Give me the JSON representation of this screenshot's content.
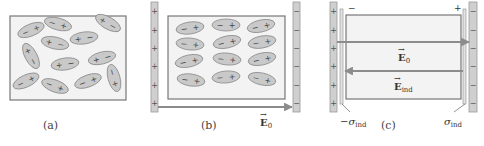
{
  "figure": {
    "colors": {
      "background": "#ffffff",
      "box_fill": "#f3f3f3",
      "box_stroke": "#777777",
      "plate_fill": "#cfcfcf",
      "plate_stroke": "#9a9a9a",
      "dipole_fill": "#c9c9c9",
      "dipole_stroke": "#8a8a8a",
      "arrow": "#8c8c8c",
      "text": "#333333"
    },
    "panels": [
      {
        "id": "a",
        "caption": "(a)",
        "description": "Randomly oriented polar molecules, no field",
        "box": {
          "x": 10,
          "y": 16,
          "w": 116,
          "h": 84
        },
        "dipoles": [
          {
            "cx": 31,
            "cy": 30,
            "rot": -22,
            "neg_left": true
          },
          {
            "cx": 58,
            "cy": 24,
            "rot": 15,
            "neg_left": true
          },
          {
            "cx": 108,
            "cy": 23,
            "rot": 30,
            "neg_left": false
          },
          {
            "cx": 55,
            "cy": 43,
            "rot": 12,
            "neg_left": false
          },
          {
            "cx": 84,
            "cy": 38,
            "rot": -8,
            "neg_left": false
          },
          {
            "cx": 31,
            "cy": 56,
            "rot": 62,
            "neg_left": false
          },
          {
            "cx": 65,
            "cy": 64,
            "rot": -8,
            "neg_left": false
          },
          {
            "cx": 102,
            "cy": 58,
            "rot": -14,
            "neg_left": false
          },
          {
            "cx": 26,
            "cy": 81,
            "rot": -25,
            "neg_left": true
          },
          {
            "cx": 55,
            "cy": 86,
            "rot": 20,
            "neg_left": true
          },
          {
            "cx": 88,
            "cy": 81,
            "rot": -20,
            "neg_left": true
          },
          {
            "cx": 114,
            "cy": 78,
            "rot": 75,
            "neg_left": true
          }
        ]
      },
      {
        "id": "b",
        "caption": "(b)",
        "description": "Dipoles aligned with external field E0",
        "box": {
          "x": 168,
          "y": 16,
          "w": 117,
          "h": 83
        },
        "left_plate": {
          "x": 151,
          "y": 2,
          "w": 7,
          "h": 110,
          "sign": "+",
          "count": 6
        },
        "right_plate": {
          "x": 293,
          "y": 2,
          "w": 7,
          "h": 110,
          "sign": "−",
          "count": 6
        },
        "field_arrow": {
          "x1": 158,
          "y1": 107,
          "x2": 292,
          "y2": 107,
          "label": "E",
          "subscript": "0"
        },
        "dipoles": [
          {
            "cx": 190,
            "cy": 28,
            "rot": -8,
            "neg_left": true
          },
          {
            "cx": 226,
            "cy": 25,
            "rot": 0,
            "neg_left": true
          },
          {
            "cx": 261,
            "cy": 26,
            "rot": -12,
            "neg_left": true
          },
          {
            "cx": 190,
            "cy": 44,
            "rot": 5,
            "neg_left": true
          },
          {
            "cx": 227,
            "cy": 42,
            "rot": -12,
            "neg_left": true
          },
          {
            "cx": 262,
            "cy": 42,
            "rot": -10,
            "neg_left": true
          },
          {
            "cx": 189,
            "cy": 61,
            "rot": -12,
            "neg_left": true
          },
          {
            "cx": 227,
            "cy": 59,
            "rot": 5,
            "neg_left": true
          },
          {
            "cx": 262,
            "cy": 59,
            "rot": -12,
            "neg_left": true
          },
          {
            "cx": 191,
            "cy": 80,
            "rot": 8,
            "neg_left": true
          },
          {
            "cx": 226,
            "cy": 77,
            "rot": -5,
            "neg_left": true
          },
          {
            "cx": 262,
            "cy": 79,
            "rot": 12,
            "neg_left": true
          }
        ]
      },
      {
        "id": "c",
        "caption": "(c)",
        "description": "Induced surface charge and induced field",
        "box": {
          "x": 346,
          "y": 15,
          "w": 115,
          "h": 84
        },
        "left_plate": {
          "x": 330,
          "y": 2,
          "w": 7,
          "h": 110,
          "sign": "+",
          "count": 6
        },
        "right_plate": {
          "x": 469,
          "y": 2,
          "w": 8,
          "h": 110,
          "sign": "−",
          "count": 6
        },
        "left_layer": {
          "x": 340,
          "y": 9,
          "w": 3,
          "h": 95
        },
        "right_layer": {
          "x": 463,
          "y": 9,
          "w": 3,
          "h": 95
        },
        "box_corner_signs": {
          "left": "−",
          "right": "+"
        },
        "field_arrow_E0": {
          "x1": 337,
          "y1": 42,
          "x2": 469,
          "y2": 42,
          "label": "E",
          "subscript": "0"
        },
        "field_arrow_Eind": {
          "x1": 463,
          "y1": 71,
          "x2": 345,
          "y2": 71,
          "label": "E",
          "subscript": "ind"
        },
        "sigma_left": {
          "label": "−σ",
          "subscript": "ind"
        },
        "sigma_right": {
          "label": "σ",
          "subscript": "ind"
        }
      }
    ]
  }
}
